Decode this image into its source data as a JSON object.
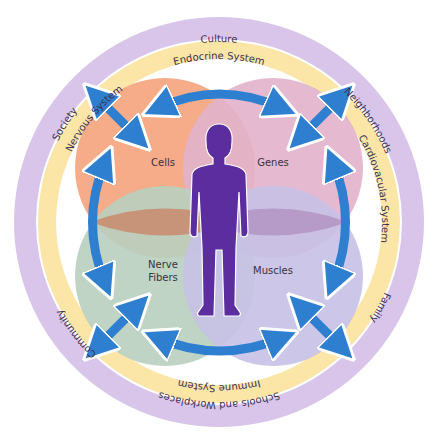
{
  "diagram": {
    "outer_ring": {
      "color": "#d9c5ea",
      "labels": {
        "top": "Culture",
        "upper_left": "Society",
        "upper_right": "Neighborhoods",
        "right": "Family",
        "bottom": "Schools and Workplaces",
        "lower_left": "Community"
      }
    },
    "inner_ring": {
      "color": "#fbe6a8",
      "labels": {
        "top": "Endocrine System",
        "left": "Nervous System",
        "right": "Cardiovacular System",
        "bottom": "Immune System"
      }
    },
    "lobes": [
      {
        "label": "Cells",
        "color": "#f5a882"
      },
      {
        "label": "Genes",
        "color": "#e2b3cc"
      },
      {
        "label": "Nerve",
        "label2": "Fibers",
        "color": "#b9cfc0"
      },
      {
        "label": "Muscles",
        "color": "#c6c1e6"
      }
    ],
    "figure_color": "#5b2d9e",
    "arrow_color": "#2f7fd0"
  }
}
